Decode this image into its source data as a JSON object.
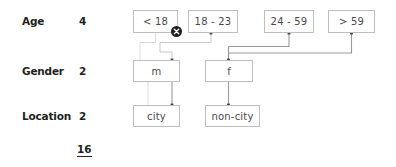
{
  "diagram": {
    "total": "16",
    "rows": [
      {
        "label": "Age",
        "count": "4"
      },
      {
        "label": "Gender",
        "count": "2"
      },
      {
        "label": "Location",
        "count": "2"
      }
    ],
    "age_nodes": [
      {
        "label": "< 18",
        "excluded": true
      },
      {
        "label": "18 - 23",
        "excluded": false
      },
      {
        "label": "24 - 59",
        "excluded": false
      },
      {
        "label": "> 59",
        "excluded": false
      }
    ],
    "gender_nodes": [
      {
        "label": "m"
      },
      {
        "label": "f"
      }
    ],
    "location_nodes": [
      {
        "label": "city"
      },
      {
        "label": "non-city"
      }
    ],
    "badge": {
      "name": "exclude-x-badge",
      "glyph": "x",
      "attached_to": "< 18"
    },
    "colors": {
      "box_border": "#bfbfbf",
      "box_text": "#4a4a4a",
      "label_text": "#231f20",
      "wire_light": "#d4d4d4",
      "wire_dark": "#8a8a8a",
      "junction_dot": "#3d3d3d",
      "badge_fill": "#231f20",
      "background": "#ffffff"
    }
  }
}
